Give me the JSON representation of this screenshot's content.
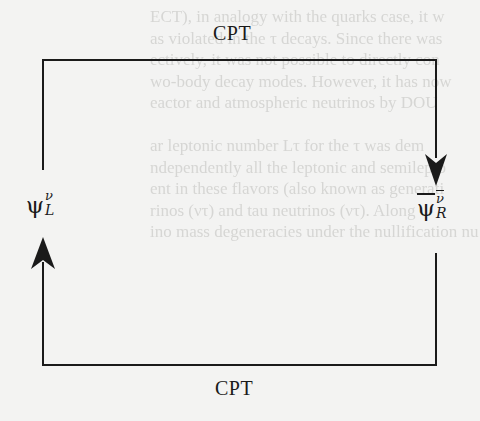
{
  "diagram": {
    "top_label": "CPT",
    "bottom_label": "CPT",
    "nodes": [
      {
        "id": "left",
        "symbol": "ψ",
        "superscript": "ν",
        "subscript": "L",
        "barred": false
      },
      {
        "id": "right",
        "symbol": "ψ",
        "superscript": "ν",
        "subscript": "R",
        "barred": true
      }
    ],
    "edges": [
      {
        "from": "left",
        "to": "right",
        "label": "CPT",
        "route": "over the top",
        "arrowhead": "down, into right node"
      },
      {
        "from": "right",
        "to": "left",
        "label": "CPT",
        "route": "along the bottom",
        "arrowhead": "up, into left node"
      }
    ],
    "colors": {
      "line": "#1a1a1a",
      "background": "#f3f3f2",
      "bleed_through": "#d6d6d4"
    }
  },
  "bleed_through_lines": [
    "ECT), in analogy with the quarks case, it w",
    "as violated in the τ decays. Since there was",
    "ectively, it was not possible to directly con",
    "wo-body decay modes. However, it has now",
    "eactor and atmospheric neutrinos by DOU",
    "",
    "ar leptonic number Lτ for the τ was dem",
    "ndependently all the leptonic and semilepto",
    "ent in these flavors (also known as generati",
    "rinos (ντ) and tau neutrinos (ντ). Along",
    "ino mass degeneracies under the nullification nu"
  ]
}
